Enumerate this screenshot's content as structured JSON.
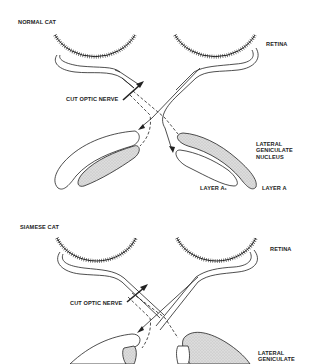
{
  "panels": [
    {
      "title": "NORMAL CAT",
      "labels": {
        "retina": "RETINA",
        "cut_optic_nerve": "CUT OPTIC NERVE",
        "lgn": "LATERAL\nGENICULATE\nNUCLEUS",
        "layer_a1": "LAYER A₁",
        "layer_a": "LAYER A"
      }
    },
    {
      "title": "SIAMESE CAT",
      "labels": {
        "retina": "RETINA",
        "cut_optic_nerve": "CUT OPTIC NERVE",
        "lgn": "LATERAL\nGENICULATE"
      }
    }
  ],
  "colors": {
    "ink": "#222222",
    "stipple": "#d4d4d4",
    "background": "#ffffff"
  }
}
